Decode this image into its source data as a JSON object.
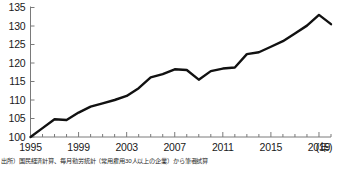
{
  "chart_data": {
    "type": "line",
    "title": "",
    "subtitle": "",
    "xlabel": "年",
    "ylabel": "",
    "xlim": [
      1995,
      2020
    ],
    "ylim": [
      100,
      135
    ],
    "ytick_values": [
      100,
      105,
      110,
      115,
      120,
      125,
      130,
      135
    ],
    "ytick_labels": [
      "100",
      "105",
      "110",
      "115",
      "120",
      "125",
      "130",
      "135"
    ],
    "xtick_values": [
      1995,
      1996,
      1997,
      1998,
      1999,
      2000,
      2001,
      2002,
      2003,
      2004,
      2005,
      2006,
      2007,
      2008,
      2009,
      2010,
      2011,
      2012,
      2013,
      2014,
      2015,
      2016,
      2017,
      2018,
      2019,
      2020
    ],
    "xtick_labeled": [
      1995,
      1999,
      2003,
      2007,
      2011,
      2015,
      2019
    ],
    "xtick_labels": [
      "1995",
      "1999",
      "2003",
      "2007",
      "2011",
      "2015",
      "2019"
    ],
    "xaxis_unit_label": "(年)",
    "grid": false,
    "legend": false,
    "legend_position": "none",
    "line_color": "#111111",
    "line_width": 2.4,
    "axis_color": "#7a7a7a",
    "x": [
      1995,
      1996,
      1997,
      1998,
      1999,
      2000,
      2001,
      2002,
      2003,
      2004,
      2005,
      2006,
      2007,
      2008,
      2009,
      2010,
      2011,
      2012,
      2013,
      2014,
      2015,
      2016,
      2017,
      2018,
      2019,
      2020
    ],
    "series": [
      {
        "name": "index",
        "values": [
          100.0,
          102.4,
          104.8,
          104.6,
          106.6,
          108.2,
          109.1,
          110.0,
          111.1,
          113.2,
          116.1,
          117.0,
          118.3,
          118.1,
          115.5,
          117.8,
          118.5,
          118.8,
          122.4,
          122.9,
          124.4,
          125.9,
          128.0,
          130.1,
          133.0,
          130.5
        ]
      }
    ]
  },
  "source": {
    "note": "出所）国民経済計算、毎月勤労統計（常用雇用30人以上の企業）から筆者試算"
  }
}
